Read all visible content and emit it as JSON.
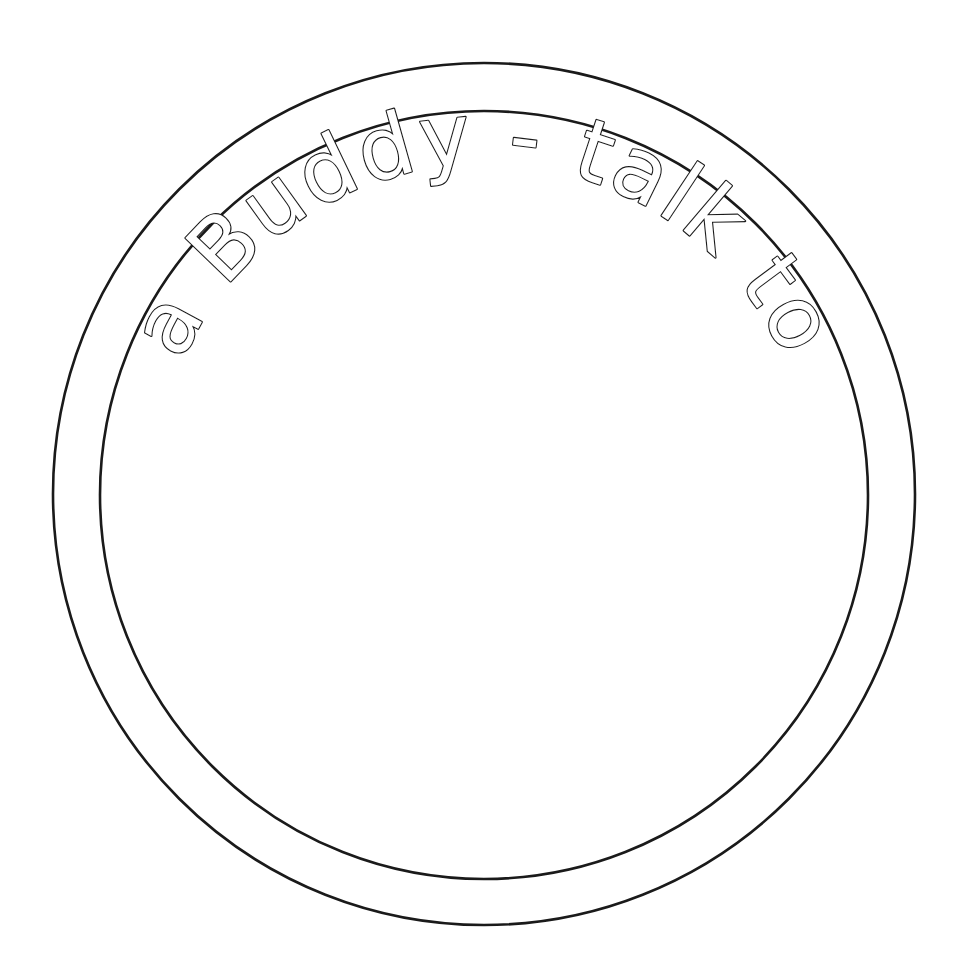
{
  "page": {
    "kind": "coloring-page-line-art",
    "background_color": "#ffffff",
    "ink_color": "#1a1a1a",
    "width": 964,
    "height": 963
  },
  "badge": {
    "outer_ring": {
      "name": "outer-circle",
      "center_x": 484,
      "center_y": 494,
      "radius": 431,
      "stroke_color": "#1a1a1a",
      "stroke_width": 2.6,
      "fill": "none"
    },
    "inner_ring": {
      "name": "inner-circle",
      "center_x": 484,
      "center_y": 495,
      "radius": 384,
      "stroke_color": "#1a1a1a",
      "stroke_width": 2.6,
      "fill": "none"
    },
    "face_area": {
      "label": "",
      "note": "blank interior to be colored"
    }
  },
  "curved_text": {
    "content": "I'm a Buddy - talk to me",
    "words": [
      "I'm",
      "a",
      "Buddy",
      "-",
      "talk",
      "to",
      "me"
    ],
    "style": "outlined hand-drawn bubble letters",
    "fill_color": "#ffffff",
    "outline_color": "#1a1a1a",
    "outline_width": 2.2,
    "font_size": 86,
    "letter_spacing": 3,
    "arc_radius": 330,
    "arc_center_x": 484,
    "arc_center_y": 494,
    "start_angle_deg": 197,
    "sweep_deg": 146,
    "baseline": "outside-up"
  }
}
